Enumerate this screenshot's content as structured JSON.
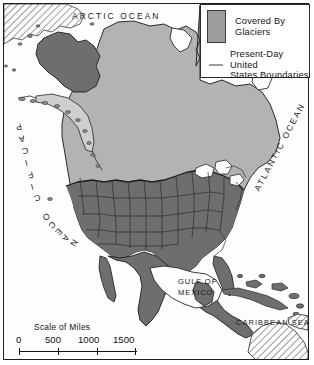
{
  "map": {
    "title": "North America Covered By Glaciers",
    "frame_color": "#1c1c1c",
    "background_color": "#ffffff",
    "land_color": "#b3b3b3",
    "glacier_color": "#8e8e8e",
    "ice_free_land_color": "#6e6e6e",
    "boundary_color": "#2a2a2a",
    "hatch_color": "#8a8a8a"
  },
  "legend": {
    "swatch_label": "Covered By\nGlaciers",
    "line_label": "Present-Day United\nStates Boundaries",
    "swatch_color": "#9d9d9d",
    "line_color": "#9a9a9a"
  },
  "labels": {
    "arctic_ocean": "ARCTIC OCEAN",
    "pacific_ocean": "PACIFIC OCEAN",
    "atlantic_ocean": "ATLANTIC OCEAN",
    "gulf_of_mexico": "GULF OF\nMEXICO",
    "caribbean_sea": "CARIBBEAN SEA"
  },
  "scale": {
    "title": "Scale of Miles",
    "ticks": [
      "0",
      "500",
      "1000",
      "1500"
    ],
    "unit": "miles",
    "max": 1500
  }
}
